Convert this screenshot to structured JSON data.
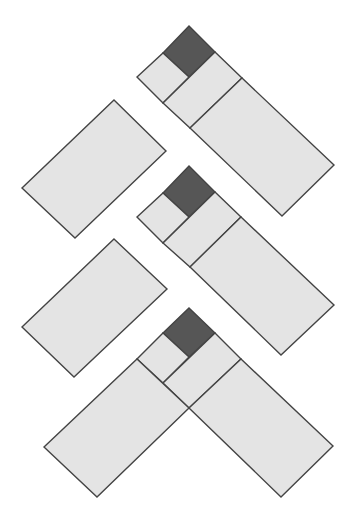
{
  "diagram": {
    "width": 354,
    "height": 515,
    "background": "#ffffff",
    "colors": {
      "light_fill": "#e4e4e4",
      "dark_fill": "#565656",
      "stroke": "#444444"
    },
    "shapes": [
      {
        "name": "fig1-dark-square",
        "fill": "dark",
        "points": [
          [
            189,
            26
          ],
          [
            215,
            52
          ],
          [
            189,
            77
          ],
          [
            163,
            53
          ]
        ]
      },
      {
        "name": "fig1-small-square",
        "fill": "light",
        "points": [
          [
            163,
            53
          ],
          [
            189,
            77
          ],
          [
            163,
            103
          ],
          [
            137,
            77
          ]
        ]
      },
      {
        "name": "fig1-mid-rect",
        "fill": "light",
        "points": [
          [
            215,
            52
          ],
          [
            242,
            78
          ],
          [
            190,
            128
          ],
          [
            163,
            103
          ]
        ]
      },
      {
        "name": "fig1-big-rect",
        "fill": "light",
        "points": [
          [
            242,
            78
          ],
          [
            334,
            165
          ],
          [
            282,
            216
          ],
          [
            190,
            128
          ]
        ]
      },
      {
        "name": "left-rect-1",
        "fill": "light",
        "points": [
          [
            114,
            100
          ],
          [
            166,
            151
          ],
          [
            75,
            238
          ],
          [
            22,
            188
          ]
        ]
      },
      {
        "name": "fig2-dark-square",
        "fill": "dark",
        "points": [
          [
            189,
            166
          ],
          [
            215,
            192
          ],
          [
            189,
            217
          ],
          [
            163,
            193
          ]
        ]
      },
      {
        "name": "fig2-small-square",
        "fill": "light",
        "points": [
          [
            163,
            193
          ],
          [
            189,
            217
          ],
          [
            163,
            243
          ],
          [
            137,
            217
          ]
        ]
      },
      {
        "name": "fig2-mid-rect",
        "fill": "light",
        "points": [
          [
            215,
            192
          ],
          [
            241,
            217
          ],
          [
            190,
            267
          ],
          [
            163,
            243
          ]
        ]
      },
      {
        "name": "fig2-big-rect",
        "fill": "light",
        "points": [
          [
            241,
            217
          ],
          [
            334,
            305
          ],
          [
            281,
            355
          ],
          [
            190,
            267
          ]
        ]
      },
      {
        "name": "left-rect-2",
        "fill": "light",
        "points": [
          [
            114,
            239
          ],
          [
            167,
            289
          ],
          [
            74,
            377
          ],
          [
            22,
            327
          ]
        ]
      },
      {
        "name": "fig3-dark-square",
        "fill": "dark",
        "points": [
          [
            189,
            308
          ],
          [
            215,
            333
          ],
          [
            189,
            357
          ],
          [
            163,
            333
          ]
        ]
      },
      {
        "name": "fig3-small-square",
        "fill": "light",
        "points": [
          [
            163,
            333
          ],
          [
            189,
            357
          ],
          [
            163,
            383
          ],
          [
            137,
            359
          ]
        ]
      },
      {
        "name": "fig3-mid-rect",
        "fill": "light",
        "points": [
          [
            215,
            333
          ],
          [
            241,
            359
          ],
          [
            189,
            408
          ],
          [
            163,
            383
          ]
        ]
      },
      {
        "name": "fig3-big-right-rect",
        "fill": "light",
        "points": [
          [
            241,
            359
          ],
          [
            333,
            446
          ],
          [
            281,
            497
          ],
          [
            189,
            408
          ]
        ]
      },
      {
        "name": "fig3-big-left-rect",
        "fill": "light",
        "points": [
          [
            137,
            359
          ],
          [
            189,
            408
          ],
          [
            97,
            497
          ],
          [
            44,
            447
          ]
        ]
      }
    ]
  }
}
